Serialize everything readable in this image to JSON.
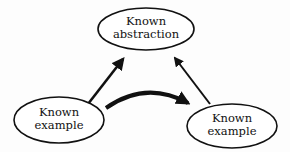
{
  "diagram": {
    "nodes": [
      {
        "id": "abstraction",
        "line1": "Known",
        "line2": "abstraction"
      },
      {
        "id": "example_left",
        "line1": "Known",
        "line2": "example"
      },
      {
        "id": "example_right",
        "line1": "Known",
        "line2": "example"
      }
    ],
    "edges": [
      {
        "from": "example_left",
        "to": "abstraction",
        "style": "straight"
      },
      {
        "from": "example_right",
        "to": "abstraction",
        "style": "straight"
      },
      {
        "from": "example_left",
        "to": "example_right",
        "style": "curved-thick"
      }
    ],
    "colors": {
      "stroke": "#111111",
      "fill": "#ffffff",
      "background": "#fdfdfd"
    }
  }
}
